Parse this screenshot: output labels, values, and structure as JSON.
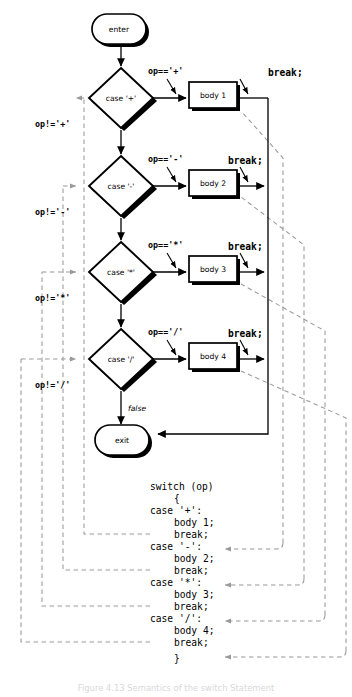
{
  "figure": {
    "caption": "Figure 4.13  Semantics of the switch Statement",
    "colors": {
      "ink": "#000000",
      "dashed": "#9a9a9a",
      "page": "#ffffff"
    }
  },
  "flowchart": {
    "start_label": "enter",
    "end_label": "exit",
    "false_label": "false",
    "branches": [
      {
        "decision": "case '+'",
        "true_label": "op=='+'",
        "false_label": "op!='+'",
        "body": "body 1",
        "break_label": "break;"
      },
      {
        "decision": "case '-'",
        "true_label": "op=='-'",
        "false_label": "op!='-'",
        "body": "body 2",
        "break_label": "break;"
      },
      {
        "decision": "case '*'",
        "true_label": "op=='*'",
        "false_label": "op!='*'",
        "body": "body 3",
        "break_label": "break;"
      },
      {
        "decision": "case '/'",
        "true_label": "op=='/'",
        "false_label": "op!='/'",
        "body": "body 4",
        "break_label": "break;"
      }
    ]
  },
  "code_listing": {
    "lines": [
      "switch (op)",
      "   {",
      "   case '+':",
      "       body 1;",
      "       break;",
      "   case '-':",
      "       body 2;",
      "       break;",
      "   case '*':",
      "       body 3;",
      "       break;",
      "   case '/':",
      "       body 4;",
      "       break;",
      "   }"
    ],
    "line_0": "switch (op)",
    "line_1": "{",
    "line_2": "case '+':",
    "line_3": "body 1;",
    "line_4": "break;",
    "line_5": "case '-':",
    "line_6": "body 2;",
    "line_7": "break;",
    "line_8": "case '*':",
    "line_9": "body 3;",
    "line_10": "break;",
    "line_11": "case '/':",
    "line_12": "body 4;",
    "line_13": "break;",
    "line_14": "}"
  }
}
